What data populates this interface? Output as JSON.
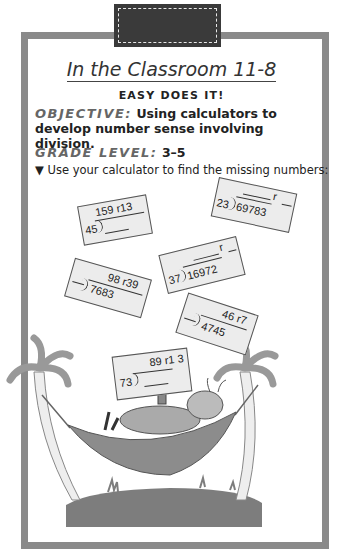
{
  "header": {
    "title": "In the Classroom 11-8",
    "subtitle": "EASY DOES IT!"
  },
  "objective": {
    "label": "OBJECTIVE:",
    "text": "Using calculators to develop number sense involving division."
  },
  "grade": {
    "label": "GRADE LEVEL:",
    "value": "3–5"
  },
  "instruction": {
    "bullet": "▼",
    "text": "Use your calculator to find the missing numbers:"
  },
  "cards": [
    {
      "divisor": "45",
      "dividend": "",
      "quotient": "159 r13"
    },
    {
      "divisor": "23",
      "dividend": "69783",
      "quotient": "r"
    },
    {
      "divisor": "",
      "dividend": "7683",
      "quotient": "98 r39"
    },
    {
      "divisor": "37",
      "dividend": "16972",
      "quotient": "r"
    },
    {
      "divisor": "",
      "dividend": "4745",
      "quotient": "46 r7"
    },
    {
      "divisor": "73",
      "dividend": "",
      "quotient": "89 r1 3"
    }
  ],
  "colors": {
    "frame": "#8a8a8a",
    "tab": "#3a3a3a",
    "card": "#ececec",
    "hammock": "#8c8c8c",
    "grass": "#7d7d7d"
  }
}
